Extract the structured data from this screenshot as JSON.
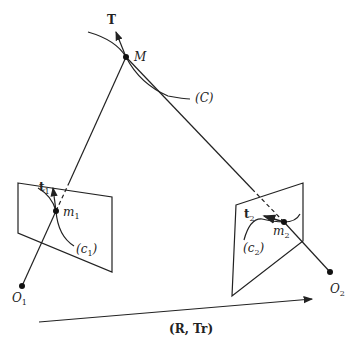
{
  "diagram": {
    "type": "epipolar-geometry",
    "labels": {
      "tangent_3d": "T",
      "point_3d": "M",
      "curve_3d": "(C)",
      "tangent_1": "t",
      "tangent_1_sub": "1",
      "point_1": "m",
      "point_1_sub": "1",
      "curve_1": "(c",
      "curve_1_sub": "1",
      "curve_1_close": ")",
      "center_1": "O",
      "center_1_sub": "1",
      "tangent_2": "t",
      "tangent_2_sub": "2",
      "point_2": "m",
      "point_2_sub": "2",
      "curve_2": "(c",
      "curve_2_sub": "2",
      "curve_2_close": ")",
      "center_2": "O",
      "center_2_sub": "2",
      "transform": "(R, Tr)"
    },
    "nodes": [
      {
        "id": "M",
        "x": 126,
        "y": 57
      },
      {
        "id": "m1",
        "x": 56,
        "y": 211
      },
      {
        "id": "O1",
        "x": 22,
        "y": 286
      },
      {
        "id": "m2",
        "x": 284,
        "y": 222
      },
      {
        "id": "O2",
        "x": 330,
        "y": 272
      }
    ],
    "edges": [
      {
        "from": "O1",
        "to": "M",
        "style": "solid/dashed-behind-plane"
      },
      {
        "from": "O2",
        "to": "M",
        "style": "solid/dashed-behind-plane"
      }
    ]
  }
}
